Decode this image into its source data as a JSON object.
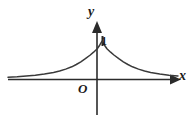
{
  "figure": {
    "caption": "Graph of an even exponential decay function peaking at 1 on the y-axis",
    "background_color": "#ffffff",
    "stroke_color": "#3a3a3a",
    "axis_color": "#2b2b2b",
    "labels": {
      "y_axis": "y",
      "x_axis": "x",
      "origin": "O",
      "peak_value": "1"
    }
  },
  "chart_data": {
    "type": "line",
    "title": "",
    "subtitle": "",
    "xlabel": "x",
    "ylabel": "y",
    "legend": [],
    "legend_position": "none",
    "grid": false,
    "annotations": [
      {
        "text": "1",
        "x": 0,
        "y": 1,
        "note": "peak value marked on y-axis"
      },
      {
        "text": "O",
        "x": 0,
        "y": 0,
        "note": "origin label"
      }
    ],
    "axis_ticks": {
      "x": [],
      "y": [
        "1"
      ]
    },
    "xlim": [
      -3.1,
      2.6
    ],
    "ylim": [
      -1.1,
      1.45
    ],
    "series": [
      {
        "name": "y = a^(-|x|), 0 < a < 1 form (even, peak 1 at x = 0)",
        "x": [
          -3.1,
          -2.8,
          -2.5,
          -2.2,
          -1.9,
          -1.6,
          -1.4,
          -1.2,
          -1.0,
          -0.85,
          -0.7,
          -0.55,
          -0.4,
          -0.28,
          -0.16,
          -0.08,
          0,
          0.08,
          0.16,
          0.28,
          0.4,
          0.55,
          0.7,
          0.85,
          1.0,
          1.2,
          1.4,
          1.6,
          1.9,
          2.2,
          2.5
        ],
        "y": [
          0.06,
          0.07,
          0.09,
          0.11,
          0.14,
          0.18,
          0.22,
          0.27,
          0.33,
          0.39,
          0.46,
          0.54,
          0.63,
          0.71,
          0.8,
          0.89,
          1.0,
          0.89,
          0.8,
          0.71,
          0.63,
          0.54,
          0.46,
          0.39,
          0.33,
          0.27,
          0.22,
          0.18,
          0.14,
          0.11,
          0.09
        ]
      }
    ]
  }
}
